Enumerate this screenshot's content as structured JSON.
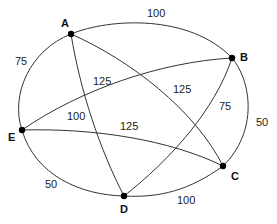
{
  "diagram": {
    "type": "weighted-graph",
    "nodes": [
      {
        "id": "A",
        "label": "A"
      },
      {
        "id": "B",
        "label": "B"
      },
      {
        "id": "C",
        "label": "C"
      },
      {
        "id": "D",
        "label": "D"
      },
      {
        "id": "E",
        "label": "E"
      }
    ],
    "edges": [
      {
        "from": "A",
        "to": "B",
        "weight": "100"
      },
      {
        "from": "B",
        "to": "C",
        "weight": "50"
      },
      {
        "from": "C",
        "to": "D",
        "weight": "100"
      },
      {
        "from": "D",
        "to": "E",
        "weight": "50"
      },
      {
        "from": "E",
        "to": "A",
        "weight": "75"
      },
      {
        "from": "A",
        "to": "C",
        "weight": "125"
      },
      {
        "from": "A",
        "to": "D",
        "weight": "100"
      },
      {
        "from": "B",
        "to": "E",
        "weight": "125"
      },
      {
        "from": "B",
        "to": "D",
        "weight": "75"
      },
      {
        "from": "E",
        "to": "C",
        "weight": "125"
      }
    ]
  }
}
